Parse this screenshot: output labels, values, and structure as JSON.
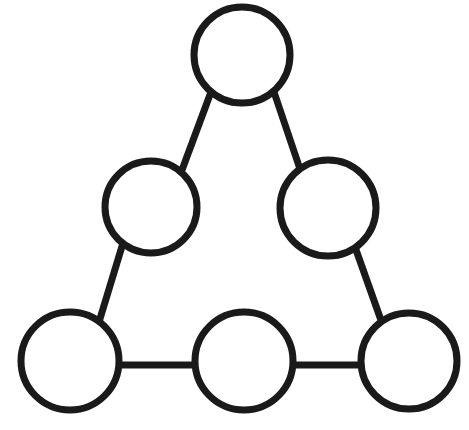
{
  "figure": {
    "background_color": "#ffffff",
    "stroke_color": "#1a1a1a",
    "stroke_width": 7,
    "width": 469,
    "height": 430
  },
  "chart_data": {
    "type": "diagram",
    "title": "",
    "xlabel": "",
    "ylabel": "",
    "layout": "triangle",
    "node_count": 6,
    "edge_count": 6,
    "nodes": [
      {
        "id": "apex",
        "label": "",
        "cx": 242,
        "cy": 55,
        "r": 48,
        "fill": "#ffffff",
        "stroke": "#1a1a1a"
      },
      {
        "id": "mid-left",
        "label": "",
        "cx": 151,
        "cy": 207,
        "r": 46,
        "fill": "#ffffff",
        "stroke": "#1a1a1a"
      },
      {
        "id": "mid-right",
        "label": "",
        "cx": 328,
        "cy": 208,
        "r": 48,
        "fill": "#ffffff",
        "stroke": "#1a1a1a"
      },
      {
        "id": "bottom-left",
        "label": "",
        "cx": 70,
        "cy": 361,
        "r": 49,
        "fill": "#ffffff",
        "stroke": "#1a1a1a"
      },
      {
        "id": "bottom-middle",
        "label": "",
        "cx": 244,
        "cy": 361,
        "r": 49,
        "fill": "#ffffff",
        "stroke": "#1a1a1a"
      },
      {
        "id": "bottom-right",
        "label": "",
        "cx": 409,
        "cy": 361,
        "r": 48,
        "fill": "#ffffff",
        "stroke": "#1a1a1a"
      }
    ],
    "edges": [
      {
        "id": "apex-midleft",
        "from": "apex",
        "to": "mid-left",
        "x1": 211,
        "y1": 92,
        "x2": 182,
        "y2": 170
      },
      {
        "id": "apex-midright",
        "from": "apex",
        "to": "mid-right",
        "x1": 274,
        "y1": 92,
        "x2": 301,
        "y2": 172
      },
      {
        "id": "midleft-bottomleft",
        "from": "mid-left",
        "to": "bottom-left",
        "x1": 123,
        "y1": 243,
        "x2": 99,
        "y2": 322
      },
      {
        "id": "midright-bottomright",
        "from": "mid-right",
        "to": "bottom-right",
        "x1": 355,
        "y1": 247,
        "x2": 382,
        "y2": 323
      },
      {
        "id": "bottomleft-bottommid",
        "from": "bottom-left",
        "to": "bottom-middle",
        "x1": 118,
        "y1": 365,
        "x2": 196,
        "y2": 365
      },
      {
        "id": "bottommid-bottomright",
        "from": "bottom-middle",
        "to": "bottom-right",
        "x1": 293,
        "y1": 365,
        "x2": 362,
        "y2": 365
      }
    ]
  }
}
